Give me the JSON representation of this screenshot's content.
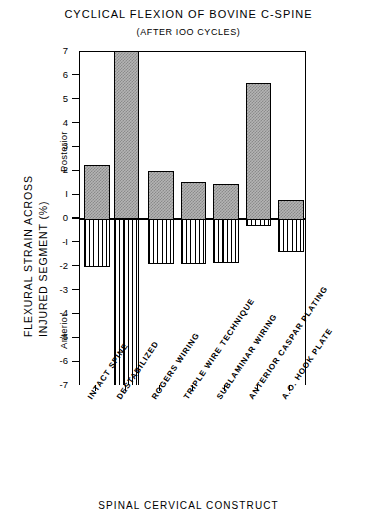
{
  "chart_data": {
    "type": "bar",
    "title": "CYCLICAL FLEXION OF BOVINE C-SPINE",
    "subtitle": "(AFTER IOO CYCLES)",
    "xlabel": "SPINAL CERVICAL CONSTRUCT",
    "ylabel_line1": "FLEXURAL STRAIN ACROSS",
    "ylabel_line2": "INJURED SEGMENT (%)",
    "direction_label_positive": "Posterior",
    "direction_label_negative": "Anterior",
    "ylim": [
      -7,
      7
    ],
    "yticks": [
      7,
      6,
      5,
      4,
      3,
      2,
      1,
      0,
      -1,
      -2,
      -3,
      -4,
      -5,
      -6,
      -7
    ],
    "ytick_labels": [
      "7",
      "6",
      "5",
      "4",
      "3",
      "2",
      "I",
      "0",
      "-I",
      "-2",
      "-3",
      "-4",
      "-5",
      "-6",
      "-7"
    ],
    "grid": false,
    "legend": "none",
    "categories": [
      "INTACT SPINE",
      "DESTABILIZED",
      "ROGERS WIRING",
      "TRIPLE WIRE TECHNIQUE",
      "SUBLAMINAR WIRING",
      "ANTERIOR CASPAR PLATING",
      "A.O. HOOK PLATE"
    ],
    "series": [
      {
        "name": "Posterior strain (positive)",
        "fill": "stippled-gray",
        "values": [
          2.25,
          7.0,
          2.0,
          1.55,
          1.45,
          5.7,
          0.8
        ],
        "clipped": [
          false,
          true,
          false,
          false,
          false,
          false,
          false
        ]
      },
      {
        "name": "Anterior strain (negative)",
        "fill": "vertical-hatch",
        "values": [
          -2.0,
          -7.0,
          -1.9,
          -1.9,
          -1.85,
          -0.3,
          -1.4
        ],
        "clipped": [
          false,
          true,
          false,
          false,
          false,
          false,
          false
        ]
      }
    ],
    "colors": {
      "positive_fill": "#b4b4b4",
      "positive_pattern": "#8a8a8a",
      "negative_fill": "#ffffff",
      "negative_pattern": "#000000",
      "axis": "#000000",
      "background": "#ffffff"
    }
  }
}
